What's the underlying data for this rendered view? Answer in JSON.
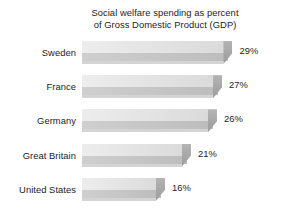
{
  "chart_data": {
    "type": "bar",
    "orientation": "horizontal",
    "title": "Social welfare spending as percent\nof Gross Domestic Product (GDP)",
    "title_line1": "Social welfare spending as percent",
    "title_line2": "of Gross Domestic Product (GDP)",
    "xlabel": "",
    "ylabel": "",
    "grid": false,
    "legend": false,
    "xlim": [
      0,
      32
    ],
    "value_suffix": "%",
    "categories": [
      "Sweden",
      "France",
      "Germany",
      "Great Britain",
      "United States"
    ],
    "values": [
      29,
      27,
      26,
      21,
      16
    ],
    "value_labels": [
      "29%",
      "27%",
      "26%",
      "21%",
      "16%"
    ],
    "rows": [
      {
        "category": "Sweden",
        "value": 29,
        "value_label": "29%"
      },
      {
        "category": "France",
        "value": 27,
        "value_label": "27%"
      },
      {
        "category": "Germany",
        "value": 26,
        "value_label": "26%"
      },
      {
        "category": "Great Britain",
        "value": 21,
        "value_label": "21%"
      },
      {
        "category": "United States",
        "value": 16,
        "value_label": "16%"
      }
    ],
    "colors": {
      "background": "#ffffff",
      "text": "#1c1c1c",
      "bar_top_face": "#e4e4e4",
      "bar_front_face": "#c6c6c6",
      "bar_end_cap": "#a8a8a8"
    }
  }
}
